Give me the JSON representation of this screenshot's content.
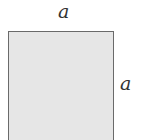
{
  "diagram": {
    "shape": "square",
    "fill_color": "#e6e6e6",
    "stroke_color": "#6a6a6a",
    "labels": {
      "top": "a",
      "right": "a"
    }
  }
}
